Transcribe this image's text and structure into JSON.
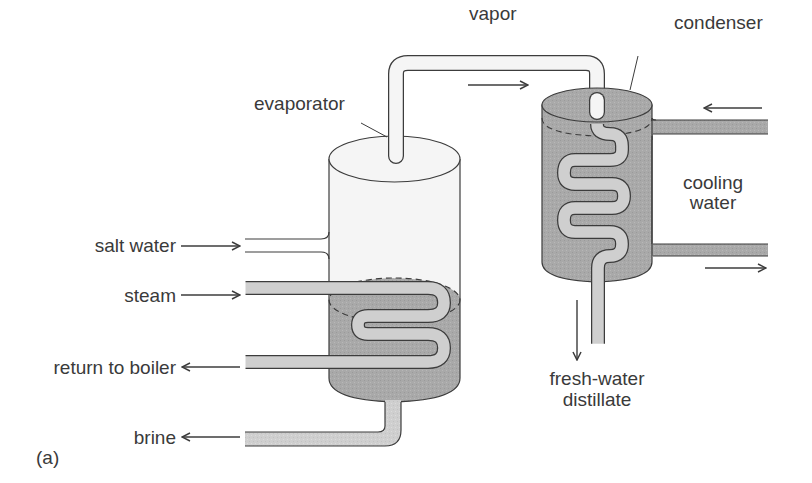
{
  "figure": {
    "panel_label": "(a)",
    "colors": {
      "liquid": "#a9a9a9",
      "tube": "#cfcfcf",
      "vapor": "#f4f4f4",
      "outline": "#3c3c3c",
      "text": "#3a3a3a"
    }
  },
  "labels": {
    "vapor": "vapor",
    "condenser": "condenser",
    "evaporator": "evaporator",
    "cooling_water_line1": "cooling",
    "cooling_water_line2": "water",
    "salt_water": "salt water",
    "steam": "steam",
    "return_to_boiler": "return to boiler",
    "brine": "brine",
    "distillate_line1": "fresh-water",
    "distillate_line2": "distillate"
  },
  "flows": [
    {
      "name": "vapor",
      "direction": "right"
    },
    {
      "name": "cooling water in",
      "direction": "left"
    },
    {
      "name": "cooling water out",
      "direction": "right"
    },
    {
      "name": "salt water",
      "direction": "right"
    },
    {
      "name": "steam",
      "direction": "right"
    },
    {
      "name": "return to boiler",
      "direction": "left"
    },
    {
      "name": "brine",
      "direction": "left"
    },
    {
      "name": "fresh-water distillate",
      "direction": "down"
    }
  ]
}
